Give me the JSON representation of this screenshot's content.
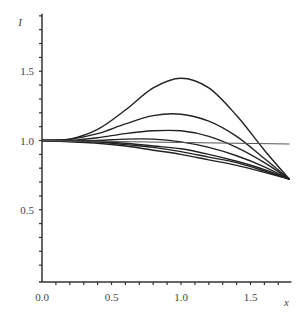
{
  "chart_data": {
    "type": "line",
    "title": "",
    "xlabel": "x",
    "ylabel": "I",
    "xlim": [
      0,
      1.78
    ],
    "ylim": [
      0,
      1.9
    ],
    "x_ticks": [
      "0.0",
      "0.5",
      "1.0",
      "1.5"
    ],
    "y_ticks": [
      "0.5",
      "1.0",
      "1.5"
    ],
    "grid": false,
    "legend": null,
    "series": [
      {
        "name": "curve-1",
        "x": [
          0,
          0.2,
          0.4,
          0.6,
          0.8,
          1.0,
          1.2,
          1.4,
          1.6,
          1.78
        ],
        "values": [
          1.0,
          1.01,
          1.08,
          1.22,
          1.38,
          1.45,
          1.38,
          1.18,
          0.93,
          0.72
        ]
      },
      {
        "name": "curve-2",
        "x": [
          0,
          0.2,
          0.4,
          0.6,
          0.8,
          1.0,
          1.2,
          1.4,
          1.6,
          1.78
        ],
        "values": [
          1.0,
          1.01,
          1.05,
          1.12,
          1.18,
          1.19,
          1.14,
          1.03,
          0.87,
          0.72
        ]
      },
      {
        "name": "curve-3",
        "x": [
          0,
          0.2,
          0.4,
          0.6,
          0.8,
          1.0,
          1.2,
          1.4,
          1.6,
          1.78
        ],
        "values": [
          1.0,
          1.0,
          1.02,
          1.05,
          1.07,
          1.07,
          1.03,
          0.95,
          0.84,
          0.72
        ]
      },
      {
        "name": "curve-4",
        "x": [
          0,
          0.2,
          0.4,
          0.6,
          0.8,
          1.0,
          1.2,
          1.4,
          1.6,
          1.78
        ],
        "values": [
          1.0,
          1.0,
          1.0,
          1.01,
          1.01,
          0.99,
          0.95,
          0.89,
          0.81,
          0.72
        ]
      },
      {
        "name": "curve-5",
        "x": [
          0,
          0.2,
          0.4,
          0.6,
          0.8,
          1.0,
          1.2,
          1.4,
          1.6,
          1.78
        ],
        "values": [
          1.0,
          1.0,
          0.99,
          0.98,
          0.96,
          0.94,
          0.9,
          0.85,
          0.79,
          0.72
        ]
      },
      {
        "name": "curve-6",
        "x": [
          0,
          0.2,
          0.4,
          0.6,
          0.8,
          1.0,
          1.2,
          1.4,
          1.6,
          1.78
        ],
        "values": [
          1.0,
          1.0,
          0.99,
          0.97,
          0.95,
          0.92,
          0.88,
          0.84,
          0.78,
          0.72
        ]
      },
      {
        "name": "curve-7",
        "x": [
          0,
          0.2,
          0.4,
          0.6,
          0.8,
          1.0,
          1.2,
          1.4,
          1.6,
          1.78
        ],
        "values": [
          1.0,
          0.99,
          0.98,
          0.96,
          0.93,
          0.9,
          0.86,
          0.82,
          0.77,
          0.72
        ]
      },
      {
        "name": "horizontal-reference",
        "x": [
          0,
          1.78
        ],
        "values": [
          1.0,
          0.975
        ]
      }
    ]
  }
}
